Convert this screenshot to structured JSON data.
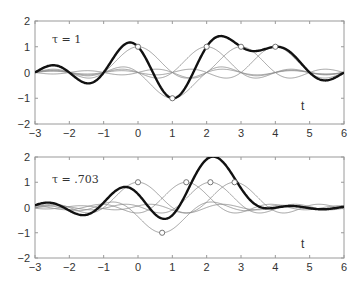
{
  "chart_data": [
    {
      "type": "line",
      "title": "",
      "annotation": "τ = 1",
      "tau": 1,
      "xlabel": "t",
      "ylabel": "",
      "xlim": [
        -3,
        6
      ],
      "ylim": [
        -2,
        2
      ],
      "xticks": [
        -3,
        -2,
        -1,
        0,
        1,
        2,
        3,
        4,
        5,
        6
      ],
      "yticks": [
        -2,
        -1,
        0,
        1,
        2
      ],
      "grid": false,
      "samples": {
        "x": [
          0,
          1,
          2,
          3,
          4
        ],
        "values": [
          1,
          -1,
          1,
          1,
          1
        ],
        "marker": "circle"
      },
      "series": [
        {
          "name": "sinc pulse n=0",
          "style": "thin-gray"
        },
        {
          "name": "sinc pulse n=1",
          "style": "thin-gray"
        },
        {
          "name": "sinc pulse n=2",
          "style": "thin-gray"
        },
        {
          "name": "sinc pulse n=3",
          "style": "thin-gray"
        },
        {
          "name": "sinc pulse n=4",
          "style": "thin-gray"
        },
        {
          "name": "sum",
          "style": "bold-black",
          "approx_points": {
            "x": [
              -3,
              -2.2,
              -1.2,
              -0.9,
              -0.1,
              1.0,
              2.2,
              3.0,
              3.9,
              5.2,
              6
            ],
            "y": [
              0,
              0.12,
              -0.3,
              0,
              1.25,
              -1.2,
              1.45,
              0.95,
              1.15,
              -0.1,
              0
            ]
          }
        }
      ]
    },
    {
      "type": "line",
      "title": "",
      "annotation": "τ = .703",
      "tau": 0.703,
      "xlabel": "t",
      "ylabel": "",
      "xlim": [
        -3,
        6
      ],
      "ylim": [
        -2,
        2
      ],
      "xticks": [
        -3,
        -2,
        -1,
        0,
        1,
        2,
        3,
        4,
        5,
        6
      ],
      "yticks": [
        -2,
        -1,
        0,
        1,
        2
      ],
      "grid": false,
      "samples": {
        "x": [
          0,
          0.703,
          1.406,
          2.109,
          2.812
        ],
        "values": [
          1,
          -1,
          1,
          1,
          1
        ],
        "marker": "circle"
      },
      "series": [
        {
          "name": "sinc pulse n=0",
          "style": "thin-gray"
        },
        {
          "name": "sinc pulse n=1",
          "style": "thin-gray"
        },
        {
          "name": "sinc pulse n=2",
          "style": "thin-gray"
        },
        {
          "name": "sinc pulse n=3",
          "style": "thin-gray"
        },
        {
          "name": "sinc pulse n=4",
          "style": "thin-gray"
        },
        {
          "name": "sum",
          "style": "bold-black",
          "approx_points": {
            "x": [
              -3,
              -2.2,
              -1.3,
              -1.0,
              -0.25,
              0.75,
              2.05,
              3.9,
              4.3,
              6
            ],
            "y": [
              0,
              0.1,
              -0.3,
              0,
              0.95,
              -0.6,
              1.9,
              0,
              -0.1,
              0
            ]
          }
        }
      ]
    }
  ],
  "plots": [
    {
      "annotation": "τ = 1",
      "xlabel": "t",
      "xtick_labels": [
        "−3",
        "−2",
        "−1",
        "0",
        "1",
        "2",
        "3",
        "4",
        "5",
        "6"
      ],
      "ytick_labels": [
        "2",
        "1",
        "0",
        "−1",
        "−2"
      ]
    },
    {
      "annotation": "τ = .703",
      "xlabel": "t",
      "xtick_labels": [
        "−3",
        "−2",
        "−1",
        "0",
        "1",
        "2",
        "3",
        "4",
        "5",
        "6"
      ],
      "ytick_labels": [
        "2",
        "1",
        "0",
        "−1",
        "−2"
      ]
    }
  ],
  "colors": {
    "sum_curve": "#111111",
    "pulse_curve": "#8a8a8a",
    "axes": "#9a9a9a",
    "marker": "#666666"
  }
}
